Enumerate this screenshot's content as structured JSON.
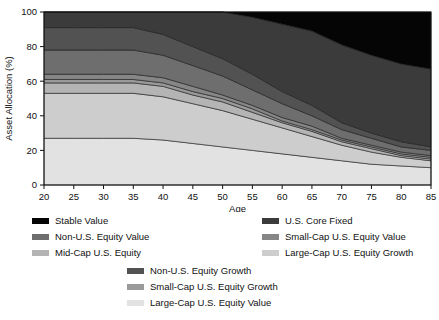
{
  "chart_data": {
    "type": "area",
    "title": "",
    "xlabel": "Age",
    "ylabel": "Asset Allocation (%)",
    "xlim": [
      20,
      85
    ],
    "ylim": [
      0,
      100
    ],
    "xticks": [
      20,
      25,
      30,
      35,
      40,
      45,
      50,
      55,
      60,
      65,
      70,
      75,
      80,
      85
    ],
    "yticks": [
      0,
      20,
      40,
      60,
      80,
      100
    ],
    "grid": false,
    "stacked": true,
    "legend_position": "below",
    "x": [
      20,
      25,
      30,
      35,
      40,
      45,
      50,
      55,
      60,
      65,
      70,
      75,
      80,
      85
    ],
    "series": [
      {
        "name": "Large-Cap U.S. Equity Value",
        "color": "#e2e2e2",
        "values": [
          27,
          27,
          27,
          27,
          26,
          24,
          22,
          20,
          18,
          16,
          14,
          12,
          11,
          10
        ]
      },
      {
        "name": "Large-Cap U.S. Equity Growth",
        "color": "#cdcdcd",
        "values": [
          26,
          26,
          26,
          26,
          25,
          23,
          21,
          18,
          15,
          12,
          9,
          7,
          5,
          4
        ]
      },
      {
        "name": "Mid-Cap U.S. Equity",
        "color": "#b4b4b4",
        "values": [
          6,
          6,
          6,
          6,
          6,
          5,
          5,
          4,
          3,
          3,
          2,
          2,
          1,
          1
        ]
      },
      {
        "name": "Small-Cap U.S. Equity Growth",
        "color": "#9a9a9a",
        "values": [
          2,
          2,
          2,
          2,
          2,
          2,
          2,
          2,
          1,
          1,
          1,
          1,
          1,
          1
        ]
      },
      {
        "name": "Small-Cap U.S. Equity Value",
        "color": "#868686",
        "values": [
          3,
          3,
          3,
          3,
          3,
          3,
          2,
          2,
          2,
          2,
          1,
          1,
          1,
          1
        ]
      },
      {
        "name": "Non-U.S. Equity Value",
        "color": "#6e6e6e",
        "values": [
          14,
          14,
          14,
          14,
          13,
          12,
          11,
          9,
          8,
          6,
          5,
          4,
          3,
          3
        ]
      },
      {
        "name": "Non-U.S. Equity Growth",
        "color": "#525252",
        "values": [
          13,
          13,
          13,
          13,
          12,
          11,
          10,
          9,
          7,
          6,
          4,
          3,
          3,
          2
        ]
      },
      {
        "name": "U.S. Core Fixed",
        "color": "#3b3b3b",
        "values": [
          9,
          9,
          9,
          9,
          13,
          20,
          27,
          33,
          39,
          43,
          45,
          45,
          45,
          45
        ]
      },
      {
        "name": "Stable Value",
        "color": "#050505",
        "values": [
          0,
          0,
          0,
          0,
          0,
          0,
          0,
          3,
          7,
          11,
          19,
          25,
          30,
          33
        ]
      }
    ]
  },
  "axes": {
    "ylabel": "Asset Allocation (%)",
    "xlabel": "Age",
    "ytick_labels": [
      "0",
      "20",
      "40",
      "60",
      "80",
      "100"
    ],
    "xtick_labels": [
      "20",
      "25",
      "30",
      "35",
      "40",
      "45",
      "50",
      "55",
      "60",
      "65",
      "70",
      "75",
      "80",
      "85"
    ]
  },
  "legend": {
    "left_column": [
      {
        "label": "Stable Value",
        "color": "#050505"
      },
      {
        "label": "Non-U.S. Equity Value",
        "color": "#6e6e6e"
      },
      {
        "label": "Mid-Cap U.S. Equity",
        "color": "#b4b4b4"
      }
    ],
    "right_column": [
      {
        "label": "U.S. Core Fixed",
        "color": "#3b3b3b"
      },
      {
        "label": "Small-Cap U.S. Equity Value",
        "color": "#868686"
      },
      {
        "label": "Large-Cap U.S. Equity Growth",
        "color": "#cdcdcd"
      }
    ],
    "bottom_column": [
      {
        "label": "Non-U.S. Equity Growth",
        "color": "#525252"
      },
      {
        "label": "Small-Cap U.S. Equity Growth",
        "color": "#9a9a9a"
      },
      {
        "label": "Large-Cap U.S. Equity Value",
        "color": "#e2e2e2"
      }
    ]
  }
}
